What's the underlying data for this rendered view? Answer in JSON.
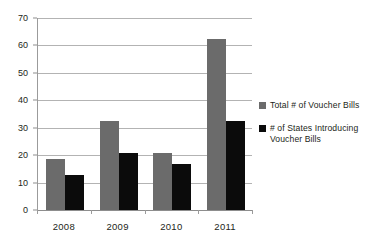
{
  "chart_data": {
    "type": "bar",
    "title": "",
    "subtitle": "",
    "xlabel": "",
    "ylabel": "",
    "categories": [
      "2008",
      "2009",
      "2010",
      "2011"
    ],
    "series": [
      {
        "name": "Total # of Voucher Bills",
        "color": "#6b6b6b",
        "values": [
          18.7,
          32.5,
          20.8,
          62.5
        ]
      },
      {
        "name": "# of States Introducing Voucher Bills",
        "color": "#0b0b0b",
        "values": [
          12.8,
          20.7,
          16.9,
          32.3
        ]
      }
    ],
    "ylim": [
      0,
      70
    ],
    "ytick_values": [
      0,
      10,
      20,
      30,
      40,
      50,
      60,
      70
    ],
    "ytick_labels": [
      "0",
      "10",
      "20",
      "30",
      "40",
      "50",
      "60",
      "70"
    ],
    "grid": true,
    "grid_orientation": "horizontal",
    "legend_position": "right",
    "legend_entries": [
      "Total # of Voucher Bills",
      "# of States Introducing Voucher Bills"
    ],
    "background_color": "#ffffff",
    "axis_color": "#9b9b9b"
  }
}
